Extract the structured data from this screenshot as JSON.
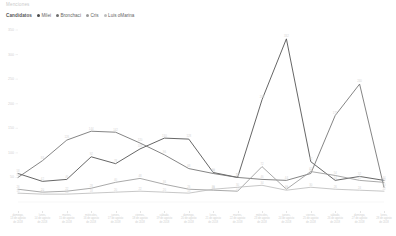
{
  "chart_title": "Menciones",
  "legend": {
    "title": "Candidatos",
    "items": [
      {
        "label": "Milei",
        "color": "#4a4a4a"
      },
      {
        "label": "Bronchaci",
        "color": "#6f6f6f"
      },
      {
        "label": "Cris",
        "color": "#9a9a9a"
      },
      {
        "label": "Luis oMarina",
        "color": "#bdbdbd"
      }
    ]
  },
  "chart_data": {
    "type": "line",
    "title": "Menciones",
    "xlabel": "",
    "ylabel": "",
    "ylim": [
      0,
      350
    ],
    "yticks": [
      0,
      50,
      100,
      150,
      200,
      250,
      300,
      350
    ],
    "ytick_labels": [
      "0",
      "50",
      "100",
      "150",
      "200",
      "250",
      "300",
      "350"
    ],
    "grid": false,
    "legend_position": "top-left",
    "categories": [
      "domingo, 13 de agosto de 2018",
      "lunes, 14 de agosto de 2018",
      "martes, 15 de agosto de 2018",
      "miércoles, 16 de agosto de 2018",
      "jueves, 17 de agosto de 2018",
      "viernes, 18 de agosto de 2018",
      "sábado, 19 de agosto de 2018",
      "domingo, 20 de agosto de 2018",
      "lunes, 21 de agosto de 2018",
      "martes, 22 de agosto de 2018",
      "miércoles, 23 de agosto de 2018",
      "jueves, 24 de agosto de 2018",
      "viernes, 25 de agosto de 2018",
      "sábado, 26 de agosto de 2018",
      "domingo, 27 de agosto de 2018",
      "lunes, 28 de agosto de 2018"
    ],
    "series": [
      {
        "name": "Milei",
        "color": "#4a4a4a",
        "values": [
          58,
          42,
          46,
          92,
          78,
          108,
          130,
          128,
          60,
          50,
          208,
          332,
          82,
          44,
          52,
          44
        ]
      },
      {
        "name": "Bronchaci",
        "color": "#6f6f6f",
        "values": [
          50,
          84,
          126,
          144,
          142,
          120,
          96,
          68,
          58,
          50,
          46,
          44,
          58,
          176,
          240,
          30
        ]
      },
      {
        "name": "Cris",
        "color": "#9a9a9a",
        "values": [
          26,
          20,
          22,
          28,
          40,
          48,
          36,
          26,
          24,
          22,
          72,
          26,
          62,
          54,
          44,
          40
        ]
      },
      {
        "name": "Luis oMarina",
        "color": "#bdbdbd",
        "values": [
          18,
          16,
          16,
          18,
          20,
          22,
          20,
          18,
          26,
          30,
          34,
          24,
          30,
          26,
          24,
          22
        ]
      }
    ]
  }
}
